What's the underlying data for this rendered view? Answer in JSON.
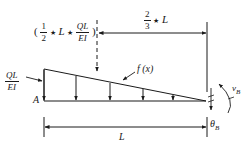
{
  "diagram": {
    "type": "beam-conjugate-load-diagram",
    "colors": {
      "stroke": "#1a1a1a",
      "background": "#ffffff"
    },
    "labels": {
      "resultant_open_paren": "(",
      "resultant_frac_num": "1",
      "resultant_frac_den": "2",
      "resultant_star1": "★",
      "resultant_L": "L",
      "resultant_star2": "★",
      "resultant_ql_num": "QL",
      "resultant_ql_den": "EI",
      "resultant_close_paren": ")",
      "distance_frac_num": "2",
      "distance_frac_den": "3",
      "distance_star": "★",
      "distance_L": "L",
      "left_load_num": "QL",
      "left_load_den": "EI",
      "load_function": "f (x)",
      "point_a": "A",
      "span_length": "L",
      "deflection_symbol": "v",
      "deflection_sub": "B",
      "rotation_symbol": "θ",
      "rotation_sub": "B"
    },
    "geometry": {
      "triangle": {
        "top_left": [
          44,
          69
        ],
        "bottom_left": [
          44,
          101
        ],
        "right": [
          206,
          101
        ]
      },
      "load_arrow_x": [
        44,
        76,
        110,
        143,
        173
      ],
      "resultant_line_x": 97,
      "end_line_x": 207
    }
  }
}
